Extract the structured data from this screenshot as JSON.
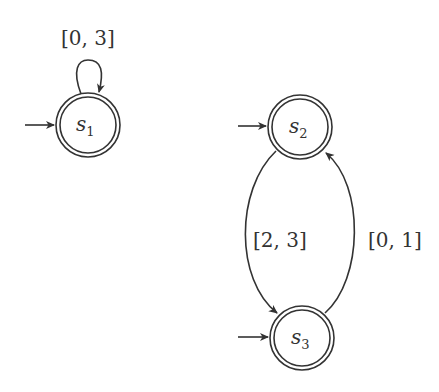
{
  "diagram": {
    "type": "timed automaton / state graph",
    "states": [
      {
        "id": "s1",
        "name": "s",
        "sub": "1",
        "initial": true,
        "accepting": true
      },
      {
        "id": "s2",
        "name": "s",
        "sub": "2",
        "initial": true,
        "accepting": true
      },
      {
        "id": "s3",
        "name": "s",
        "sub": "3",
        "initial": true,
        "accepting": true
      }
    ],
    "edges": [
      {
        "from": "s1",
        "to": "s1",
        "label": "[0, 3]"
      },
      {
        "from": "s2",
        "to": "s3",
        "label": "[2, 3]"
      },
      {
        "from": "s3",
        "to": "s2",
        "label": "[0, 1]"
      }
    ]
  }
}
